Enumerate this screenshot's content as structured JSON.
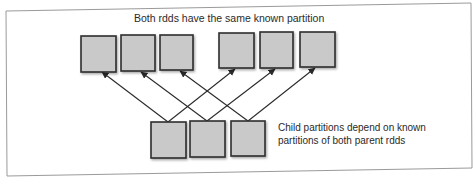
{
  "diagram": {
    "title": "Both rdds have the same known partition",
    "annotation": {
      "line1": "Child partitions depend on known",
      "line2": "partitions of both parent rdds"
    },
    "colors": {
      "background": "#ffffff",
      "frame": "#9a9a9a",
      "box_fill": "#c9c9c9",
      "box_stroke": "#2e2e2e",
      "arrow": "#2a2a2a",
      "text": "#2a2a2a"
    },
    "parent_rdd_1": {
      "label": "Parent RDD 1 partitions",
      "partitions": [
        {
          "id": "p1-0",
          "x": 81,
          "y": 36,
          "w": 35,
          "h": 36
        },
        {
          "id": "p1-1",
          "x": 121,
          "y": 35,
          "w": 34,
          "h": 36
        },
        {
          "id": "p1-2",
          "x": 160,
          "y": 35,
          "w": 33,
          "h": 35
        }
      ]
    },
    "parent_rdd_2": {
      "label": "Parent RDD 2 partitions",
      "partitions": [
        {
          "id": "p2-0",
          "x": 219,
          "y": 33,
          "w": 35,
          "h": 35
        },
        {
          "id": "p2-1",
          "x": 260,
          "y": 32,
          "w": 33,
          "h": 36
        },
        {
          "id": "p2-2",
          "x": 300,
          "y": 32,
          "w": 35,
          "h": 35
        }
      ]
    },
    "child_rdd": {
      "label": "Child RDD partitions",
      "partitions": [
        {
          "id": "c-0",
          "x": 151,
          "y": 122,
          "w": 35,
          "h": 36
        },
        {
          "id": "c-1",
          "x": 190,
          "y": 121,
          "w": 35,
          "h": 36
        },
        {
          "id": "c-2",
          "x": 231,
          "y": 121,
          "w": 34,
          "h": 35
        }
      ]
    },
    "dependencies": [
      {
        "from": "c-0",
        "to": "p1-0",
        "x1": 168,
        "y1": 122,
        "x2": 102,
        "y2": 72
      },
      {
        "from": "c-0",
        "to": "p2-0",
        "x1": 168,
        "y1": 122,
        "x2": 235,
        "y2": 69
      },
      {
        "from": "c-1",
        "to": "p1-1",
        "x1": 207,
        "y1": 121,
        "x2": 141,
        "y2": 72
      },
      {
        "from": "c-1",
        "to": "p2-1",
        "x1": 207,
        "y1": 121,
        "x2": 275,
        "y2": 69
      },
      {
        "from": "c-2",
        "to": "p1-2",
        "x1": 248,
        "y1": 121,
        "x2": 180,
        "y2": 71
      },
      {
        "from": "c-2",
        "to": "p2-2",
        "x1": 248,
        "y1": 121,
        "x2": 315,
        "y2": 68
      }
    ]
  }
}
